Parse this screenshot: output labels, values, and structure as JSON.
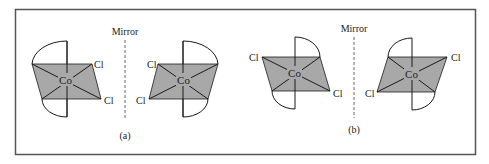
{
  "figure": {
    "colors": {
      "frame": "#555555",
      "shade": "#a8a8a8",
      "line": "#1a1a1a",
      "mirror": "#666666"
    },
    "panels": [
      {
        "label": "(a)",
        "mirror_label": "Mirror",
        "molecules": [
          {
            "center": "Co",
            "ligands": [
              "Cl",
              "Cl"
            ]
          },
          {
            "center": "Co",
            "ligands": [
              "Cl",
              "Cl"
            ]
          }
        ]
      },
      {
        "label": "(b)",
        "mirror_label": "Mirror",
        "molecules": [
          {
            "center": "Co",
            "ligands": [
              "Cl",
              "Cl"
            ]
          },
          {
            "center": "Co",
            "ligands": [
              "Cl",
              "Cl"
            ]
          }
        ]
      }
    ]
  }
}
